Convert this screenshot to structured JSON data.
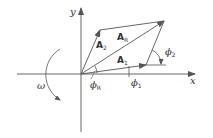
{
  "diagram": {
    "colors": {
      "line": "#555555",
      "text": "#333333",
      "background": "#ffffff"
    },
    "axes": {
      "x_label": "x",
      "y_label": "y"
    },
    "vectors": [
      {
        "id": "A1",
        "label_main": "A",
        "label_sub": "1"
      },
      {
        "id": "A2",
        "label_main": "A",
        "label_sub": "2"
      },
      {
        "id": "AR",
        "label_main": "A",
        "label_sub": "R"
      }
    ],
    "angles": [
      {
        "id": "phi1",
        "label_main": "ϕ",
        "label_sub": "1"
      },
      {
        "id": "phi2",
        "label_main": "ϕ",
        "label_sub": "2"
      },
      {
        "id": "phiR",
        "label_main": "ϕ",
        "label_sub": "R"
      }
    ],
    "rotation": {
      "label": "ω",
      "direction": "clockwise"
    }
  }
}
